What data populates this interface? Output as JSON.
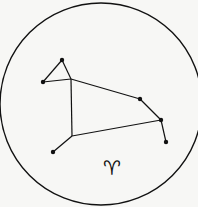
{
  "diagram": {
    "symbol": "♈",
    "colors": {
      "background": "#f7f7f5",
      "ink": "#111111"
    },
    "circle": {
      "cx": 101,
      "cy": 104,
      "r": 101
    },
    "stars": [
      {
        "id": "top",
        "x": 62,
        "y": 60
      },
      {
        "id": "left",
        "x": 43,
        "y": 82
      },
      {
        "id": "mid-right",
        "x": 140,
        "y": 99
      },
      {
        "id": "right",
        "x": 161,
        "y": 120
      },
      {
        "id": "far-right",
        "x": 166,
        "y": 142
      },
      {
        "id": "bottom-left",
        "x": 53,
        "y": 152
      }
    ],
    "lines": [
      [
        43,
        82,
        62,
        60
      ],
      [
        62,
        60,
        71,
        79
      ],
      [
        43,
        82,
        71,
        79
      ],
      [
        71,
        79,
        140,
        99
      ],
      [
        140,
        99,
        161,
        120
      ],
      [
        161,
        120,
        166,
        142
      ],
      [
        71,
        79,
        72,
        136
      ],
      [
        72,
        136,
        161,
        120
      ],
      [
        72,
        136,
        53,
        152
      ]
    ]
  }
}
